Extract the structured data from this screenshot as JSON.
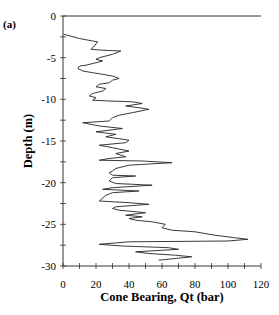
{
  "panel_label": "(a)",
  "chart_data": {
    "type": "line",
    "title": "",
    "panel": "(a)",
    "xlabel": "Cone Bearing, Qt (bar)",
    "ylabel": "Depth (m)",
    "xlim": [
      0,
      120
    ],
    "ylim": [
      -30,
      0
    ],
    "x_ticks": [
      0,
      20,
      40,
      60,
      80,
      100,
      120
    ],
    "x_tick_labels": [
      "0",
      "20",
      "40",
      "60",
      "80",
      "100",
      "120"
    ],
    "x_minor_step": 10,
    "y_ticks": [
      0,
      -5,
      -10,
      -15,
      -20,
      -25,
      -30
    ],
    "y_tick_labels": [
      "0",
      "-5",
      "-10",
      "-15",
      "-20",
      "-25",
      "-30"
    ],
    "y_minor_step": 2.5,
    "grid": false,
    "legend": null,
    "series": [
      {
        "name": "Cone Bearing profile",
        "color": "#222222",
        "points": [
          [
            0.5,
            -2.2
          ],
          [
            10,
            -2.7
          ],
          [
            18,
            -3.0
          ],
          [
            21,
            -3.1
          ],
          [
            19,
            -3.6
          ],
          [
            17,
            -4.0
          ],
          [
            24,
            -4.1
          ],
          [
            35,
            -4.2
          ],
          [
            30,
            -4.6
          ],
          [
            22,
            -5.0
          ],
          [
            20,
            -5.2
          ],
          [
            24,
            -5.4
          ],
          [
            20,
            -5.6
          ],
          [
            14,
            -5.9
          ],
          [
            10,
            -6.0
          ],
          [
            9,
            -6.3
          ],
          [
            12,
            -6.6
          ],
          [
            18,
            -6.8
          ],
          [
            24,
            -7.0
          ],
          [
            30,
            -7.2
          ],
          [
            34,
            -7.5
          ],
          [
            30,
            -7.7
          ],
          [
            28,
            -8.0
          ],
          [
            22,
            -8.2
          ],
          [
            20,
            -8.5
          ],
          [
            26,
            -8.7
          ],
          [
            24,
            -9.0
          ],
          [
            18,
            -9.3
          ],
          [
            16,
            -9.6
          ],
          [
            20,
            -9.8
          ],
          [
            18,
            -10.1
          ],
          [
            28,
            -10.2
          ],
          [
            42,
            -10.3
          ],
          [
            48,
            -10.5
          ],
          [
            38,
            -10.8
          ],
          [
            46,
            -11.0
          ],
          [
            52,
            -11.2
          ],
          [
            42,
            -11.6
          ],
          [
            34,
            -11.9
          ],
          [
            30,
            -12.2
          ],
          [
            28,
            -12.6
          ],
          [
            12,
            -12.8
          ],
          [
            22,
            -13.2
          ],
          [
            36,
            -13.5
          ],
          [
            20,
            -13.9
          ],
          [
            32,
            -14.2
          ],
          [
            26,
            -14.5
          ],
          [
            40,
            -14.9
          ],
          [
            38,
            -15.2
          ],
          [
            22,
            -15.5
          ],
          [
            30,
            -15.8
          ],
          [
            40,
            -16.2
          ],
          [
            32,
            -16.5
          ],
          [
            38,
            -16.9
          ],
          [
            28,
            -17.1
          ],
          [
            22,
            -17.3
          ],
          [
            48,
            -17.4
          ],
          [
            66,
            -17.6
          ],
          [
            40,
            -17.9
          ],
          [
            32,
            -18.3
          ],
          [
            30,
            -18.6
          ],
          [
            28,
            -18.8
          ],
          [
            30,
            -19.1
          ],
          [
            44,
            -19.2
          ],
          [
            30,
            -19.4
          ],
          [
            28,
            -19.8
          ],
          [
            32,
            -20.1
          ],
          [
            54,
            -20.3
          ],
          [
            30,
            -20.6
          ],
          [
            24,
            -20.8
          ],
          [
            46,
            -21.0
          ],
          [
            30,
            -21.2
          ],
          [
            26,
            -21.5
          ],
          [
            22,
            -22.2
          ],
          [
            40,
            -22.4
          ],
          [
            52,
            -22.6
          ],
          [
            32,
            -22.9
          ],
          [
            30,
            -23.1
          ],
          [
            34,
            -23.3
          ],
          [
            50,
            -23.6
          ],
          [
            38,
            -23.9
          ],
          [
            48,
            -24.1
          ],
          [
            40,
            -24.3
          ],
          [
            44,
            -24.5
          ],
          [
            54,
            -24.7
          ],
          [
            62,
            -25.0
          ],
          [
            60,
            -25.4
          ],
          [
            66,
            -25.7
          ],
          [
            80,
            -25.9
          ],
          [
            92,
            -26.3
          ],
          [
            104,
            -26.6
          ],
          [
            112,
            -26.8
          ],
          [
            100,
            -27.0
          ],
          [
            40,
            -27.1
          ],
          [
            22,
            -27.4
          ],
          [
            36,
            -27.6
          ],
          [
            64,
            -27.8
          ],
          [
            70,
            -28.0
          ],
          [
            44,
            -28.3
          ],
          [
            52,
            -28.5
          ],
          [
            68,
            -28.7
          ],
          [
            78,
            -28.9
          ],
          [
            58,
            -29.3
          ]
        ]
      }
    ]
  }
}
